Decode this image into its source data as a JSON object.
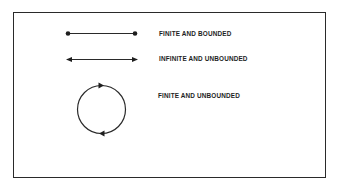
{
  "diagram": {
    "items": [
      {
        "shape": "line-segment-with-endpoints",
        "label": "FINITE AND BOUNDED"
      },
      {
        "shape": "line-with-arrows-both-ends",
        "label": "INFINITE AND UNBOUNDED"
      },
      {
        "shape": "circle-with-arrows",
        "label": "FINITE AND UNBOUNDED"
      }
    ],
    "colors": {
      "ink": "#1e1e1e",
      "background": "#ffffff"
    }
  }
}
